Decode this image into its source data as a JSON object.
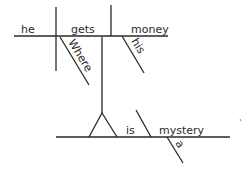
{
  "diagram": {
    "type": "sentence-diagram",
    "sentence": "Where he gets his money is a mystery",
    "words": {
      "subject": "he",
      "verb": "gets",
      "object": "money",
      "adverb_modifier": "Where",
      "possessive_modifier": "his",
      "main_verb": "is",
      "predicate_nominative": "mystery",
      "article": "a"
    },
    "colors": {
      "line": "#2a2a2a",
      "background": "#ffffff"
    }
  }
}
